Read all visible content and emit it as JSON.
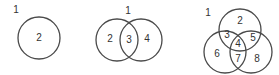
{
  "diagrams": [
    {
      "name": "one-set",
      "outside_label": "1",
      "circles": [
        {
          "cx": 39,
          "cy": 38,
          "r": 21
        }
      ],
      "regions": [
        {
          "label": "2",
          "x": 39,
          "y": 37
        }
      ],
      "outside_pos": {
        "x": 16,
        "y": 9
      }
    },
    {
      "name": "two-set",
      "outside_label": "1",
      "circles": [
        {
          "cx": 117,
          "cy": 40,
          "r": 21
        },
        {
          "cx": 141,
          "cy": 40,
          "r": 21
        }
      ],
      "regions": [
        {
          "label": "2",
          "x": 110,
          "y": 38
        },
        {
          "label": "3",
          "x": 129,
          "y": 39
        },
        {
          "label": "4",
          "x": 147,
          "y": 38
        }
      ],
      "outside_pos": {
        "x": 128,
        "y": 10
      }
    },
    {
      "name": "three-set",
      "outside_label": "1",
      "circles": [
        {
          "cx": 240,
          "cy": 30,
          "r": 21
        },
        {
          "cx": 225,
          "cy": 52,
          "r": 21
        },
        {
          "cx": 251,
          "cy": 52,
          "r": 21
        }
      ],
      "regions": [
        {
          "label": "2",
          "x": 240,
          "y": 20
        },
        {
          "label": "3",
          "x": 227,
          "y": 34
        },
        {
          "label": "5",
          "x": 253,
          "y": 37
        },
        {
          "label": "4",
          "x": 238,
          "y": 43
        },
        {
          "label": "6",
          "x": 217,
          "y": 53
        },
        {
          "label": "7",
          "x": 238,
          "y": 58
        },
        {
          "label": "8",
          "x": 257,
          "y": 58
        }
      ],
      "outside_pos": {
        "x": 208,
        "y": 12
      }
    }
  ],
  "colors": {
    "stroke": "#4a4a4a",
    "text": "#333333",
    "background": "#ffffff"
  }
}
